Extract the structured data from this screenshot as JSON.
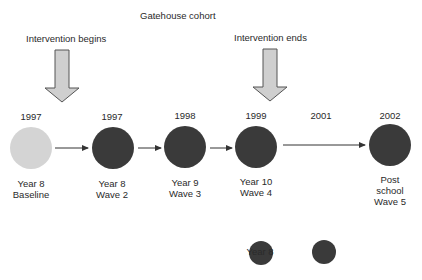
{
  "title": "Gatehouse cohort",
  "annotations": {
    "start": "Intervention begins",
    "end": "Intervention ends"
  },
  "waves": [
    {
      "year": "1997",
      "line1": "Year 8",
      "line2": "Baseline",
      "line3": "",
      "shade": "light"
    },
    {
      "year": "1997",
      "line1": "Year 8",
      "line2": "Wave 2",
      "line3": "",
      "shade": "dark"
    },
    {
      "year": "1998",
      "line1": "Year 9",
      "line2": "Wave 3",
      "line3": "",
      "shade": "dark"
    },
    {
      "year": "1999",
      "line1": "Year 10",
      "line2": "Wave 4",
      "line3": "",
      "shade": "dark"
    },
    {
      "year": "2002",
      "line1": "Post",
      "line2": "school",
      "line3": "Wave 5",
      "shade": "dark"
    }
  ],
  "gap_year": "2001",
  "subsequent": {
    "items": [
      {
        "label": "Year 8"
      },
      {
        "label": "Year 8"
      }
    ],
    "caption": "Subsequent surveys"
  },
  "colors": {
    "dark_circle": "#3a3a3a",
    "light_circle": "#d4d4d4",
    "block_arrow_fill": "#cfcfcf",
    "block_arrow_stroke": "#555555",
    "line": "#333333"
  }
}
